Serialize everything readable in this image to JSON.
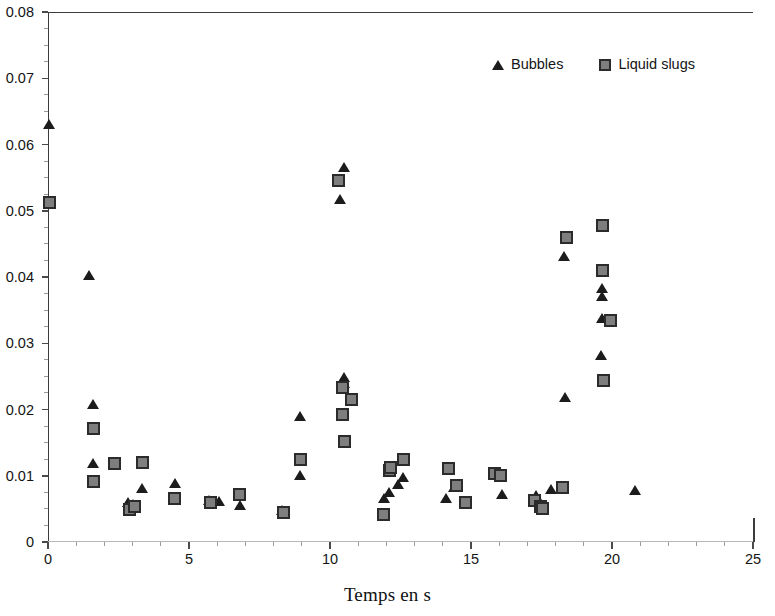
{
  "chart_data": {
    "type": "scatter",
    "title": "",
    "xlabel": "Temps en s",
    "ylabel": "",
    "xlim": [
      0,
      25
    ],
    "ylim": [
      0,
      0.08
    ],
    "grid": false,
    "legend_position": "top-right",
    "x_ticks": [
      "0",
      "5",
      "10",
      "15",
      "20",
      "25"
    ],
    "x_tick_values": [
      0,
      5,
      10,
      15,
      20,
      25
    ],
    "y_ticks": [
      "0",
      "0.01",
      "0.02",
      "0.03",
      "0.04",
      "0.05",
      "0.06",
      "0.07",
      "0.08"
    ],
    "y_tick_values": [
      0,
      0.01,
      0.02,
      0.03,
      0.04,
      0.05,
      0.06,
      0.07,
      0.08
    ],
    "x_minor_step": 1,
    "y_minor_step": 0.0025,
    "series": [
      {
        "name": "Bubbles",
        "marker": "triangle",
        "color": "#1c1c1c",
        "points": [
          [
            0.05,
            0.063
          ],
          [
            1.45,
            0.0403
          ],
          [
            1.6,
            0.0208
          ],
          [
            1.6,
            0.0118
          ],
          [
            2.85,
            0.006
          ],
          [
            3.0,
            0.0057
          ],
          [
            3.35,
            0.0081
          ],
          [
            4.5,
            0.0089
          ],
          [
            5.7,
            0.0063
          ],
          [
            6.05,
            0.0061
          ],
          [
            6.8,
            0.0055
          ],
          [
            8.3,
            0.0047
          ],
          [
            8.95,
            0.0101
          ],
          [
            8.95,
            0.0189
          ],
          [
            10.35,
            0.0517
          ],
          [
            10.5,
            0.0565
          ],
          [
            10.5,
            0.0249
          ],
          [
            10.5,
            0.024
          ],
          [
            11.9,
            0.0065
          ],
          [
            12.1,
            0.0075
          ],
          [
            12.4,
            0.0087
          ],
          [
            12.6,
            0.0097
          ],
          [
            14.4,
            0.0083
          ],
          [
            14.5,
            0.0087
          ],
          [
            14.1,
            0.0066
          ],
          [
            15.9,
            0.0104
          ],
          [
            16.1,
            0.0072
          ],
          [
            17.3,
            0.007
          ],
          [
            17.4,
            0.006
          ],
          [
            17.85,
            0.0079
          ],
          [
            18.3,
            0.0431
          ],
          [
            18.35,
            0.0218
          ],
          [
            19.65,
            0.0383
          ],
          [
            19.65,
            0.037
          ],
          [
            19.65,
            0.0337
          ],
          [
            19.6,
            0.0281
          ],
          [
            20.8,
            0.0078
          ]
        ]
      },
      {
        "name": "Liquid slugs",
        "marker": "square",
        "color": "#7e7e7e",
        "points": [
          [
            0.05,
            0.0512
          ],
          [
            1.6,
            0.0172
          ],
          [
            1.6,
            0.0091
          ],
          [
            2.35,
            0.0118
          ],
          [
            2.9,
            0.0049
          ],
          [
            3.05,
            0.0053
          ],
          [
            3.35,
            0.012
          ],
          [
            4.5,
            0.0065
          ],
          [
            5.75,
            0.0059
          ],
          [
            6.8,
            0.0071
          ],
          [
            8.35,
            0.0045
          ],
          [
            8.95,
            0.0125
          ],
          [
            10.3,
            0.0545
          ],
          [
            10.45,
            0.0233
          ],
          [
            10.45,
            0.0192
          ],
          [
            10.5,
            0.0152
          ],
          [
            10.75,
            0.0215
          ],
          [
            11.9,
            0.0042
          ],
          [
            12.1,
            0.0108
          ],
          [
            12.15,
            0.0113
          ],
          [
            12.6,
            0.0125
          ],
          [
            14.2,
            0.0111
          ],
          [
            14.5,
            0.0085
          ],
          [
            14.8,
            0.0059
          ],
          [
            15.85,
            0.0104
          ],
          [
            16.05,
            0.0101
          ],
          [
            17.25,
            0.0063
          ],
          [
            17.45,
            0.0053
          ],
          [
            17.55,
            0.0051
          ],
          [
            18.25,
            0.0082
          ],
          [
            18.4,
            0.046
          ],
          [
            19.65,
            0.0478
          ],
          [
            19.65,
            0.041
          ],
          [
            19.95,
            0.0335
          ],
          [
            19.7,
            0.0244
          ]
        ]
      }
    ]
  },
  "legend": {
    "entries": [
      {
        "label": "Bubbles"
      },
      {
        "label": "Liquid slugs"
      }
    ]
  }
}
